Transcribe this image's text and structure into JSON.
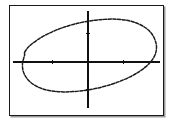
{
  "app": {
    "title": "Graphing calculator plot",
    "background_color": "#ffffff"
  },
  "graph": {
    "frame": {
      "name": "plot-frame",
      "border_color": "#1a1a1a",
      "shadow_color": "#9a9a9a",
      "fill_color": "#ffffff",
      "x": 9,
      "y": 5,
      "width": 155,
      "height": 111
    },
    "axes": {
      "color": "#111111",
      "x_axis": {
        "label": "x-axis",
        "y_position": 57,
        "x_start": 3,
        "x_end": 152
      },
      "y_axis": {
        "label": "y-axis",
        "x_position": 79,
        "y_start": 5,
        "y_end": 104
      },
      "tick_length": 4,
      "x_ticks": [
        {
          "label": "x-tick-left",
          "position": 43
        },
        {
          "label": "x-tick-right",
          "position": 115
        }
      ],
      "y_ticks": [
        {
          "label": "y-tick-upper",
          "position": 28
        },
        {
          "label": "y-tick-lower",
          "position": 85
        }
      ]
    },
    "origin": {
      "x": 79,
      "y": 57
    }
  },
  "chart_data": {
    "type": "line",
    "title": "",
    "subtitle": "",
    "xlabel": "",
    "ylabel": "",
    "grid": false,
    "legend": null,
    "curve_style": "dotted",
    "curve_color": "#1b1b1b",
    "shape": "ellipse",
    "center": {
      "x": 0.32,
      "y": 0.18
    },
    "semi_major_axis": 4.35,
    "semi_minor_axis": 1.55,
    "rotation_degrees": -27,
    "axis_ranges": {
      "xlim": [
        -4.7,
        4.7
      ],
      "ylim": [
        -3.0,
        3.3
      ]
    },
    "x": [
      -4.05,
      -3.85,
      -3.52,
      -3.1,
      -2.6,
      -2.05,
      -1.45,
      -0.85,
      -0.22,
      0.4,
      1.02,
      1.62,
      2.2,
      2.75,
      3.25,
      3.7,
      4.05,
      4.28,
      4.38,
      4.3,
      4.05,
      3.68,
      3.22,
      2.7,
      2.12,
      1.52,
      0.9,
      0.28,
      -0.35,
      -0.98,
      -1.58,
      -2.15,
      -2.7,
      -3.2,
      -3.62,
      -3.95,
      -4.15,
      -4.18,
      -4.05
    ],
    "y": [
      0.62,
      0.92,
      1.22,
      1.52,
      1.8,
      2.06,
      2.28,
      2.46,
      2.6,
      2.7,
      2.76,
      2.78,
      2.74,
      2.64,
      2.46,
      2.2,
      1.86,
      1.44,
      0.98,
      0.5,
      0.06,
      -0.32,
      -0.66,
      -0.96,
      -1.22,
      -1.44,
      -1.62,
      -1.76,
      -1.86,
      -1.92,
      -1.94,
      -1.9,
      -1.8,
      -1.62,
      -1.36,
      -1.0,
      -0.56,
      -0.06,
      0.45
    ]
  }
}
